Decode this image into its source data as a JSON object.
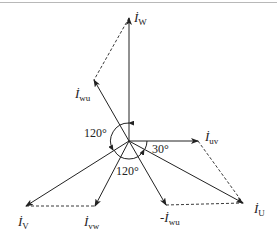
{
  "diagram": {
    "type": "phasor diagram",
    "origin": [
      129,
      141
    ],
    "phasors": [
      {
        "id": "iW",
        "base": "İ",
        "sub": "W",
        "tip": [
          129,
          18
        ],
        "style": "solid"
      },
      {
        "id": "iwu",
        "base": "İ",
        "sub": "wu",
        "tip": [
          94,
          80
        ],
        "style": "solid"
      },
      {
        "id": "iuv",
        "base": "İ",
        "sub": "uv",
        "tip": [
          198,
          141
        ],
        "style": "solid"
      },
      {
        "id": "iU",
        "base": "İ",
        "sub": "U",
        "tip": [
          243,
          203
        ],
        "style": "solid"
      },
      {
        "id": "iV",
        "base": "İ",
        "sub": "V",
        "tip": [
          26,
          206
        ],
        "style": "solid"
      },
      {
        "id": "ivw",
        "base": "İ",
        "sub": "vw",
        "tip": [
          95,
          206
        ],
        "style": "solid"
      },
      {
        "id": "neg_iwu",
        "base": "-İ",
        "sub": "wu",
        "tip": [
          166,
          205
        ],
        "style": "solid"
      }
    ],
    "dashed_lines": [
      {
        "from": [
          129,
          18
        ],
        "to": [
          94,
          80
        ]
      },
      {
        "from": [
          198,
          141
        ],
        "to": [
          243,
          203
        ]
      },
      {
        "from": [
          26,
          206
        ],
        "to": [
          95,
          206
        ]
      },
      {
        "from": [
          166,
          205
        ],
        "to": [
          243,
          203
        ]
      }
    ],
    "labels": {
      "iW": {
        "base": "İ",
        "sub": "W"
      },
      "iwu": {
        "base": "İ",
        "sub": "wu"
      },
      "iuv": {
        "base": "İ",
        "sub": "uv"
      },
      "iU": {
        "base": "İ",
        "sub": "U"
      },
      "iV": {
        "base": "İ",
        "sub": "V"
      },
      "ivw": {
        "base": "İ",
        "sub": "vw"
      },
      "neg_iwu": {
        "base": "-İ",
        "sub": "wu"
      }
    },
    "angles": {
      "left": "120°",
      "bottom": "120°",
      "right": "30°"
    },
    "colors": {
      "line": "#222222",
      "border": "#b8b8b8"
    }
  }
}
